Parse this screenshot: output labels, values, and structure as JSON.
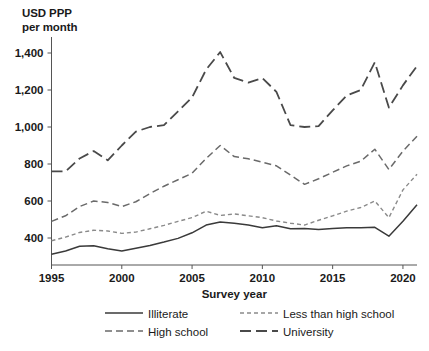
{
  "chart_data": {
    "type": "line",
    "title": "",
    "ylabel": "USD PPP\nper month",
    "xlabel": "Survey year",
    "xlim": [
      1995,
      2021
    ],
    "ylim": [
      280,
      1450
    ],
    "xticks": [
      1995,
      2000,
      2005,
      2010,
      2015,
      2020
    ],
    "yticks": [
      400,
      600,
      800,
      1000,
      1200,
      1400
    ],
    "ytick_labels": [
      "400",
      "600",
      "800",
      "1,000",
      "1,200",
      "1,400"
    ],
    "xtick_labels": [
      "1995",
      "2000",
      "2005",
      "2010",
      "2015",
      "2020"
    ],
    "grid": false,
    "legend_position": "bottom",
    "x": [
      1995,
      1996,
      1997,
      1998,
      1999,
      2000,
      2001,
      2002,
      2003,
      2004,
      2005,
      2006,
      2007,
      2008,
      2009,
      2010,
      2011,
      2012,
      2013,
      2014,
      2015,
      2016,
      2017,
      2018,
      2019,
      2020,
      2021
    ],
    "series": [
      {
        "name": "Illiterate",
        "style": "solid",
        "color": "#3a3a3a",
        "values": [
          312,
          330,
          355,
          358,
          342,
          330,
          345,
          360,
          378,
          398,
          428,
          470,
          487,
          480,
          470,
          455,
          466,
          450,
          452,
          446,
          452,
          455,
          455,
          458,
          410,
          490,
          580
        ]
      },
      {
        "name": "Less than high school",
        "style": "dotted",
        "color": "#8a8a8a",
        "values": [
          385,
          405,
          430,
          442,
          438,
          425,
          432,
          450,
          468,
          490,
          510,
          545,
          522,
          530,
          520,
          510,
          492,
          480,
          470,
          496,
          520,
          545,
          565,
          600,
          510,
          660,
          745
        ]
      },
      {
        "name": "High school",
        "style": "dashed",
        "color": "#6a6a6a",
        "values": [
          490,
          520,
          570,
          600,
          592,
          570,
          596,
          640,
          680,
          715,
          750,
          830,
          900,
          840,
          828,
          810,
          790,
          740,
          690,
          720,
          755,
          790,
          815,
          880,
          770,
          870,
          950
        ]
      },
      {
        "name": "University",
        "style": "longdash",
        "color": "#4a4a4a",
        "values": [
          760,
          760,
          830,
          870,
          820,
          900,
          975,
          1000,
          1010,
          1085,
          1160,
          1310,
          1405,
          1265,
          1240,
          1265,
          1190,
          1010,
          1000,
          1005,
          1090,
          1170,
          1200,
          1350,
          1105,
          1225,
          1330
        ]
      }
    ]
  },
  "legend": {
    "entries": [
      {
        "label": "Illiterate",
        "style": "solid"
      },
      {
        "label": "Less than high school",
        "style": "dotted"
      },
      {
        "label": "High school",
        "style": "dashed"
      },
      {
        "label": "University",
        "style": "longdash"
      }
    ]
  }
}
